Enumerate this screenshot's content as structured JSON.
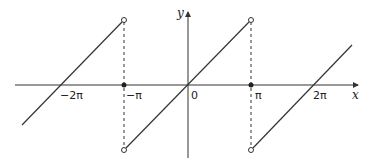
{
  "figure": {
    "type": "function-graph",
    "axes": {
      "x_label": "x",
      "y_label": "y",
      "origin_label": "0"
    },
    "tick_labels": [
      "−2π",
      "−π",
      "0",
      "π",
      "2π"
    ],
    "discontinuities": [
      {
        "x": "−π",
        "open_top": true,
        "open_bottom": true,
        "filled_at_axis": true
      },
      {
        "x": "π",
        "open_top": true,
        "open_bottom": true,
        "filled_at_axis": true
      }
    ],
    "colors": {
      "line": "#333333",
      "axis": "#333333"
    }
  }
}
